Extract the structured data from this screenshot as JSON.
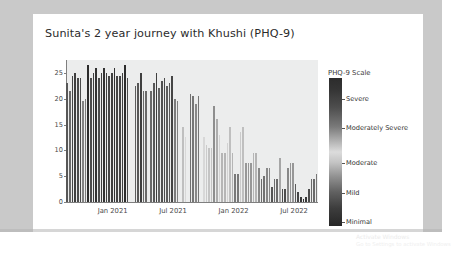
{
  "slide": {
    "title": "Sunita's 2 year journey with Khushi (PHQ-9)",
    "watermark_line1": "Activate Windows",
    "watermark_line2": "Go to Settings to activate Windows"
  },
  "legend": {
    "title": "PHQ-9 Scale",
    "labels": [
      {
        "text": "Severe",
        "pos": 0.145
      },
      {
        "text": "Moderately Severe",
        "pos": 0.335
      },
      {
        "text": "Moderate",
        "pos": 0.575
      },
      {
        "text": "Mild",
        "pos": 0.775
      },
      {
        "text": "Minimal",
        "pos": 0.975
      }
    ],
    "gradient_stops": [
      "#2c2c2c",
      "#4e4e4e",
      "#b4b4b4",
      "#dcdcdc",
      "#949494",
      "#3d3d3d",
      "#262626"
    ]
  },
  "chart_data": {
    "type": "bar",
    "title": "Sunita's 2 year journey with Khushi (PHQ-9)",
    "xlabel": "",
    "ylabel": "",
    "ylim": [
      0,
      27.5
    ],
    "yticks": [
      0,
      5,
      10,
      15,
      20,
      25
    ],
    "xticks": [
      {
        "label": "Jan 2021",
        "pos": 0.185
      },
      {
        "label": "Jul 2021",
        "pos": 0.425
      },
      {
        "label": "Jan 2022",
        "pos": 0.665
      },
      {
        "label": "Jul 2022",
        "pos": 0.905
      }
    ],
    "grid": false,
    "colormap": "grayscale-diverging",
    "series_name": "PHQ-9 score",
    "values": [
      23,
      21.5,
      24.5,
      25,
      24,
      24,
      19.5,
      20,
      26.5,
      24,
      25,
      26,
      24,
      25,
      26,
      25,
      24.5,
      25,
      26,
      24.5,
      24.5,
      25,
      26.5,
      24,
      0,
      0,
      22.5,
      23,
      25,
      21.5,
      21.5,
      0,
      21.5,
      23,
      25,
      22,
      23.5,
      24,
      22.5,
      23,
      24.5,
      20,
      19.5,
      0,
      14.5,
      12.5,
      0,
      21,
      20.5,
      19,
      20.5,
      0,
      12.5,
      11,
      10.5,
      10.5,
      18.5,
      16,
      13,
      9.5,
      9.5,
      11.5,
      14.5,
      9.5,
      5.5,
      5.5,
      13.5,
      14.5,
      7.5,
      7.5,
      7.5,
      9.5,
      9.5,
      6.5,
      4.5,
      5,
      6.5,
      6.5,
      3,
      4.5,
      4.5,
      8.5,
      2.5,
      2.5,
      6.5,
      7.5,
      7.5,
      3.5,
      2,
      1,
      0.5,
      1,
      2.5,
      4.5,
      4.5,
      5.5
    ]
  }
}
